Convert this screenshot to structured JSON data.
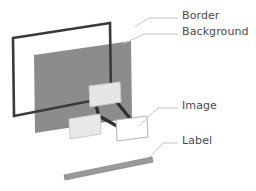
{
  "diagram": {
    "background_color": "#ffffff",
    "callouts": [
      {
        "id": "border",
        "label": "Border",
        "text_x": 182,
        "text_y": 16,
        "leader": "M 135,27 L 149,18 L 178,18"
      },
      {
        "id": "background",
        "label": "Background",
        "text_x": 182,
        "text_y": 32,
        "leader": "M 123,44 L 144,34 L 178,34"
      },
      {
        "id": "image",
        "label": "Image",
        "text_x": 182,
        "text_y": 106,
        "leader": "M 139,126 L 158,108 L 178,108"
      },
      {
        "id": "label",
        "label": "Label",
        "text_x": 182,
        "text_y": 141,
        "leader": "M 150,157 L 163,143 L 178,143"
      }
    ],
    "shapes": {
      "border_frame": {
        "name": "Border",
        "color": "#3a3a3c",
        "stroke_width": 2.6,
        "outline": "M 13,38 L 110,23 L 111,97 L 14,116 Z"
      },
      "background_panel": {
        "name": "Background",
        "fill": "#8c8c8c",
        "outline": "M 34,55 L 131,41 L 132,118 L 35,133 Z"
      },
      "image_group": {
        "name": "Image",
        "connector_color": "#2f2f31",
        "connector_width": 3.2,
        "connectors": [
          "M 95,102 L 99,116",
          "M 115,100 L 133,122",
          "M 99,116 L 86,127",
          "M 99,116 L 124,130"
        ],
        "nodes": [
          {
            "name": "image-node-top",
            "fill": "#e6e6e6",
            "stroke": "#c9c9c9",
            "outline": "M 89,86 L 120,82 L 121,102 L 90,107 Z"
          },
          {
            "name": "image-node-left",
            "fill": "#e8e8e8",
            "stroke": "#cccccc",
            "outline": "M 69,119 L 100,114 L 101,134 L 70,139 Z"
          },
          {
            "name": "image-node-right",
            "fill": "#ffffff",
            "stroke": "#b3b3b3",
            "outline": "M 116,120 L 147,116 L 148,137 L 117,141 Z"
          }
        ]
      },
      "label_bar": {
        "name": "Label",
        "fill": "#9a9a9a",
        "stroke": "#7d7d7d",
        "outline": "M 64,175 L 152,157 L 153,162 L 65,180 Z"
      }
    },
    "leader_line": {
      "color": "#c4c4c4",
      "width": 1
    }
  }
}
